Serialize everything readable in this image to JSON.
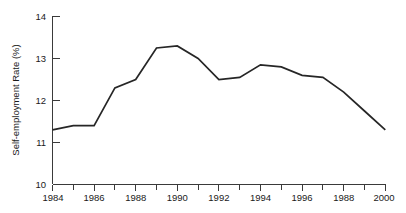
{
  "chart_data": {
    "type": "line",
    "title": "",
    "xlabel": "",
    "ylabel": "Self-employment Rate (%)",
    "x": [
      1984,
      1985,
      1986,
      1987,
      1988,
      1989,
      1990,
      1991,
      1992,
      1993,
      1994,
      1995,
      1996,
      1997,
      1998,
      1999,
      2000
    ],
    "values": [
      11.3,
      11.4,
      11.4,
      12.3,
      12.5,
      13.25,
      13.3,
      13.0,
      12.5,
      12.55,
      12.85,
      12.8,
      12.6,
      12.55,
      12.2,
      11.75,
      11.3
    ],
    "series": [
      {
        "name": "Self-employment Rate",
        "values": [
          11.3,
          11.4,
          11.4,
          12.3,
          12.5,
          13.25,
          13.3,
          13.0,
          12.5,
          12.55,
          12.85,
          12.8,
          12.6,
          12.55,
          12.2,
          11.75,
          11.3
        ]
      }
    ],
    "xlim": [
      1984,
      2000
    ],
    "ylim": [
      10,
      14
    ],
    "y_ticks": [
      10,
      11,
      12,
      13,
      14
    ],
    "y_tick_labels": [
      "10",
      "11",
      "12",
      "13",
      "14"
    ],
    "x_ticks": [
      1984,
      1986,
      1988,
      1990,
      1992,
      1994,
      1996,
      1998,
      2000
    ],
    "x_tick_labels": [
      "1984",
      "1986",
      "1988",
      "1990",
      "1992",
      "1994",
      "1996",
      "1988",
      "2000"
    ],
    "x_minor_ticks": [
      1985,
      1987,
      1989,
      1991,
      1993,
      1995,
      1997,
      1999
    ],
    "grid": false,
    "legend": false,
    "legend_position": "none",
    "line_color": "#262626",
    "axis_color": "#3a3a3a"
  }
}
